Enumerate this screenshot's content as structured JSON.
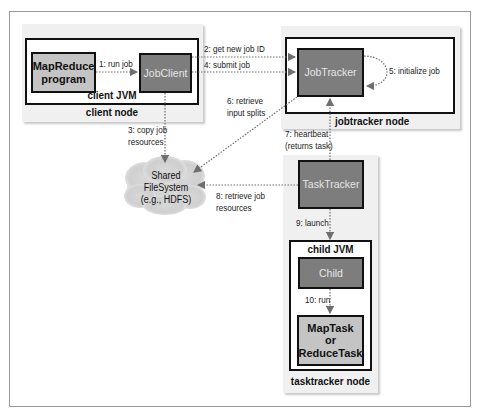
{
  "diagram": {
    "client_node": {
      "label": "client node",
      "jvm_label": "client JVM",
      "mapreduce_program": "MapReduce program",
      "job_client": "JobClient"
    },
    "jobtracker_node": {
      "label": "jobtracker node",
      "job_tracker": "JobTracker"
    },
    "shared_fs": {
      "line1": "Shared",
      "line2": "FileSystem",
      "line3": "(e.g., HDFS)"
    },
    "tasktracker_node": {
      "label": "tasktracker node",
      "task_tracker": "TaskTracker",
      "child_jvm_label": "child JVM",
      "child": "Child",
      "task_line1": "MapTask",
      "task_line2": "or",
      "task_line3": "ReduceTask"
    },
    "steps": {
      "s1": "1: run job",
      "s2": "2: get new job ID",
      "s3a": "3: copy job",
      "s3b": "resources",
      "s4": "4: submit job",
      "s5": "5: initialize job",
      "s6a": "6: retrieve",
      "s6b": "input splits",
      "s7a": "7: heartbeat",
      "s7b": "(returns task)",
      "s8a": "8: retrieve job",
      "s8b": "resources",
      "s9": "9: launch",
      "s10": "10: run"
    },
    "colors": {
      "dark_box": "#7d7d7d",
      "light_box": "#c4c4c4",
      "arrow": "#6e6e6e",
      "node_bg": "#f0f0f0"
    }
  }
}
